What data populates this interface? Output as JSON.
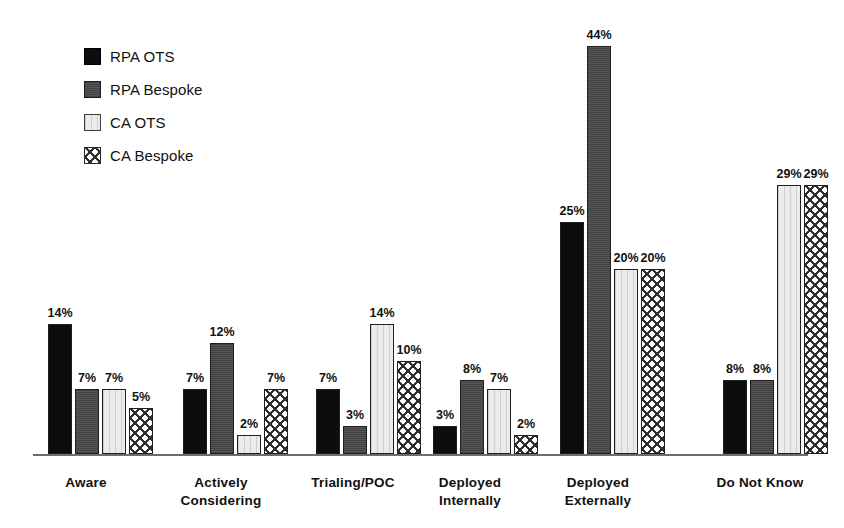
{
  "legend": {
    "items": [
      {
        "label": "RPA OTS",
        "key": "rpa_ots",
        "swatch": "solid-black-swatch"
      },
      {
        "label": "RPA Bespoke",
        "key": "rpa_bespoke",
        "swatch": "dark-gray-swatch"
      },
      {
        "label": "CA OTS",
        "key": "ca_ots",
        "swatch": "light-gray-swatch"
      },
      {
        "label": "CA Bespoke",
        "key": "ca_bespoke",
        "swatch": "crosshatch-swatch"
      }
    ]
  },
  "chart_data": {
    "type": "bar",
    "title": "",
    "xlabel": "",
    "ylabel": "",
    "grid": false,
    "legend_position": "top-left",
    "value_label_suffix": "%",
    "ylim": [
      0,
      44
    ],
    "categories": [
      "Aware",
      "Actively Considering",
      "Trialing/POC",
      "Deployed Internally",
      "Deployed Externally",
      "Do Not Know"
    ],
    "series": [
      {
        "name": "RPA OTS",
        "color": "#0d0d0d",
        "values": [
          14,
          7,
          7,
          3,
          25,
          8
        ]
      },
      {
        "name": "RPA Bespoke",
        "color": "#4d4d4d",
        "values": [
          7,
          12,
          3,
          8,
          44,
          8
        ]
      },
      {
        "name": "CA OTS",
        "color": "#ececec",
        "values": [
          7,
          2,
          14,
          7,
          20,
          29
        ]
      },
      {
        "name": "CA Bespoke",
        "color": "#ffffff",
        "values": [
          5,
          7,
          10,
          2,
          20,
          29
        ]
      }
    ],
    "value_labels": [
      [
        "14%",
        "7%",
        "7%",
        "5%"
      ],
      [
        "7%",
        "12%",
        "2%",
        "7%"
      ],
      [
        "7%",
        "3%",
        "14%",
        "10%"
      ],
      [
        "3%",
        "8%",
        "7%",
        "2%"
      ],
      [
        "25%",
        "44%",
        "20%",
        "20%"
      ],
      [
        "8%",
        "8%",
        "29%",
        "29%"
      ]
    ],
    "category_label_lines": [
      [
        "Aware"
      ],
      [
        "Actively",
        "Considering"
      ],
      [
        "Trialing/POC"
      ],
      [
        "Deployed",
        "Internally"
      ],
      [
        "Deployed",
        "Externally"
      ],
      [
        "Do Not Know"
      ]
    ]
  }
}
